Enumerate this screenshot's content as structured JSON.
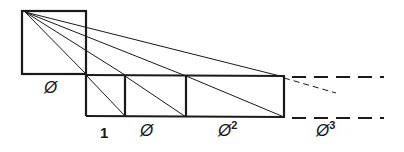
{
  "diagram": {
    "stroke_color": "#1a1a1a",
    "labels": {
      "big_square": "Ø",
      "unit": "1",
      "phi": "Ø",
      "phi2_base": "Ø",
      "phi2_exp": "2",
      "phi3_base": "Ø",
      "phi3_exp": "3"
    }
  }
}
